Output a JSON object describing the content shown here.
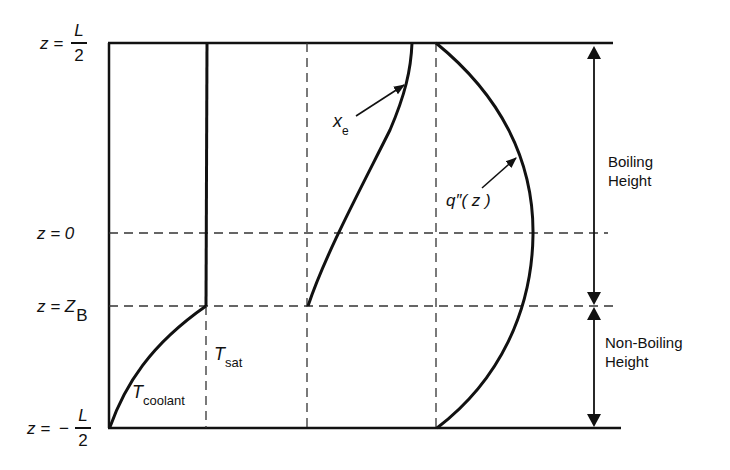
{
  "diagram": {
    "title": "",
    "z_labels": {
      "top": {
        "lhs": "z =",
        "sign": "",
        "num": "L",
        "den": "2"
      },
      "zero": "z = 0",
      "zb": {
        "lhs": "z = Z",
        "sub": "B"
      },
      "bottom": {
        "lhs": "z =",
        "sign": "−",
        "num": "L",
        "den": "2"
      }
    },
    "curves": {
      "t_coolant": {
        "main": "T",
        "sub": "coolant"
      },
      "t_sat": {
        "main": "T",
        "sub": "sat"
      },
      "x_e": {
        "main": "x",
        "sub": "e"
      },
      "q_flux": "q″( z )"
    },
    "regions": {
      "boiling": [
        "Boiling",
        "Height"
      ],
      "non_boiling": [
        "Non-Boiling",
        "Height"
      ]
    },
    "colors": {
      "ink": "#111111",
      "background": "#ffffff"
    }
  }
}
